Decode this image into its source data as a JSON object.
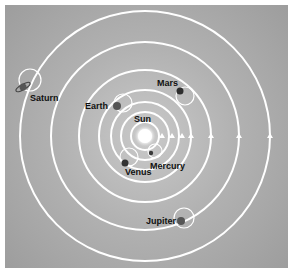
{
  "diagram": {
    "type": "solar-system-orbits",
    "colors": {
      "background": "#b0b0b0",
      "orbit": "#ffffff",
      "planet": "#3a3a3a",
      "sun": "#ffffff",
      "label": "#111111"
    },
    "sun": {
      "label": "Sun",
      "cx": 145,
      "cy": 136
    },
    "planets": [
      {
        "name": "Mercury",
        "label": "Mercury"
      },
      {
        "name": "Venus",
        "label": "Venus"
      },
      {
        "name": "Earth",
        "label": "Earth"
      },
      {
        "name": "Mars",
        "label": "Mars"
      },
      {
        "name": "Jupiter",
        "label": "Jupiter"
      },
      {
        "name": "Saturn",
        "label": "Saturn"
      }
    ]
  }
}
